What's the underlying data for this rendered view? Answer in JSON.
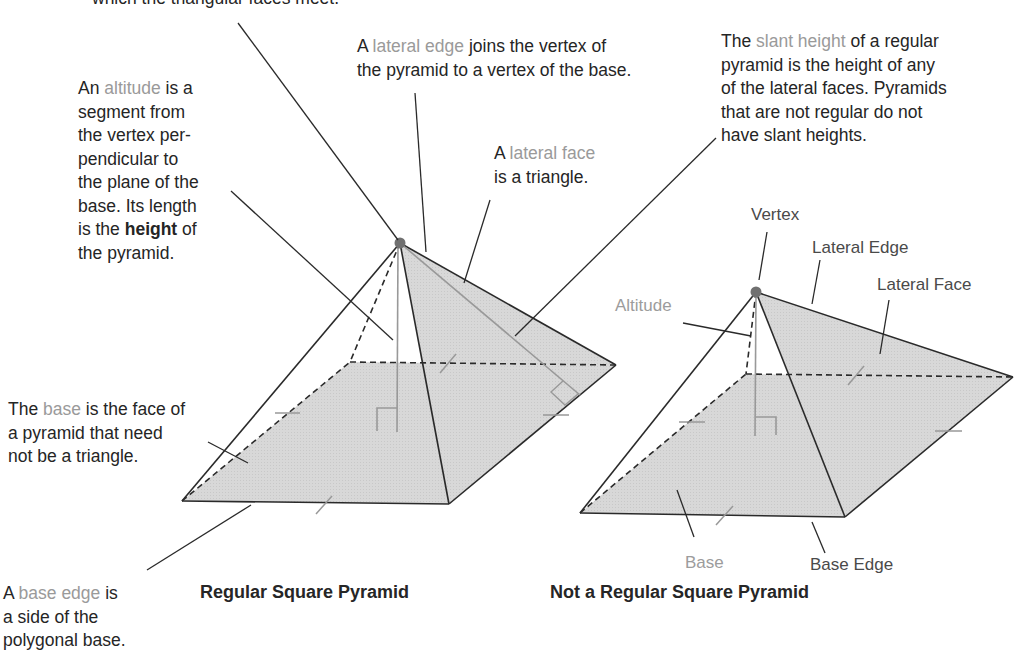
{
  "top_note": {
    "line1": "which the triangular faces meet."
  },
  "annotations": {
    "altitude": {
      "pre": "An ",
      "term": "altitude",
      "post": " is a",
      "lines": [
        "segment from",
        "the vertex per-",
        "pendicular to",
        "the plane of the",
        "base. Its length"
      ],
      "last_pre": "is the ",
      "last_bold": "height",
      "last_post": " of",
      "final": "the pyramid."
    },
    "lateral_edge": {
      "pre": "A ",
      "term": "lateral edge",
      "post": " joins the vertex of",
      "line2": "the pyramid to a vertex of the base."
    },
    "lateral_face": {
      "pre": "A ",
      "term": "lateral face",
      "line2": "is a triangle."
    },
    "slant_height": {
      "pre": "The ",
      "term": "slant height",
      "post": " of a regular",
      "lines": [
        "pyramid is the height of any",
        "of the lateral faces. Pyramids",
        "that are not regular do not",
        "have slant heights."
      ]
    },
    "base": {
      "pre": "The ",
      "term": "base",
      "post": " is the face of",
      "lines": [
        "a pyramid that need",
        "not be a triangle."
      ]
    },
    "base_edge": {
      "pre": "A ",
      "term": "base edge",
      "post": " is",
      "lines": [
        "a side of the",
        "polygonal base."
      ]
    }
  },
  "figures": {
    "regular": {
      "caption": "Regular Square Pyramid"
    },
    "not_regular": {
      "caption": "Not a Regular Square Pyramid",
      "labels": {
        "vertex": "Vertex",
        "lateral_edge": "Lateral Edge",
        "lateral_face": "Lateral Face",
        "altitude": "Altitude",
        "base": "Base",
        "base_edge": "Base Edge"
      }
    }
  },
  "colors": {
    "face_fill": "#d6d6d6",
    "highlight_text": "#9a9a9a",
    "line": "#2a2a2a",
    "vertex_dot": "#707070"
  }
}
